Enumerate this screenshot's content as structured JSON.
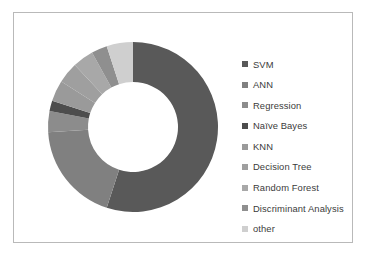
{
  "figure": {
    "background": "#ffffff",
    "frame_color": "#b9b9b9"
  },
  "legend": {
    "position": "right",
    "items": [
      {
        "label": "SVM",
        "color": "#595959",
        "swatch": "square-marker"
      },
      {
        "label": "ANN",
        "color": "#808080",
        "swatch": "square-marker"
      },
      {
        "label": "Regression",
        "color": "#8c8c8c",
        "swatch": "square-marker"
      },
      {
        "label": "Naïve Bayes",
        "color": "#4d4d4d",
        "swatch": "square-marker"
      },
      {
        "label": "KNN",
        "color": "#9a9a9a",
        "swatch": "square-marker"
      },
      {
        "label": "Decision Tree",
        "color": "#9f9f9f",
        "swatch": "square-marker"
      },
      {
        "label": "Random Forest",
        "color": "#a8a8a8",
        "swatch": "square-marker"
      },
      {
        "label": "Discriminant Analysis",
        "color": "#8f8f8f",
        "swatch": "square-marker"
      },
      {
        "label": "other",
        "color": "#cfcfcf",
        "swatch": "square-marker"
      }
    ]
  },
  "chart_data": {
    "type": "pie",
    "variant": "donut",
    "title": "",
    "subtitle": "",
    "xlabel": "",
    "ylabel": "",
    "grid": false,
    "legend_position": "right",
    "start_angle_deg": 0,
    "direction": "clockwise",
    "inner_radius_ratio": 0.53,
    "center": {
      "x": 95,
      "y": 96
    },
    "outer_radius": 85,
    "inner_radius": 45,
    "labels": [
      "SVM",
      "ANN",
      "Regression",
      "Naïve Bayes",
      "KNN",
      "Decision Tree",
      "Random Forest",
      "Discriminant Analysis",
      "other"
    ],
    "values": [
      55,
      19,
      4,
      2,
      4,
      4,
      4,
      3,
      5
    ],
    "colors": [
      "#595959",
      "#808080",
      "#8c8c8c",
      "#4d4d4d",
      "#9a9a9a",
      "#9f9f9f",
      "#a8a8a8",
      "#8f8f8f",
      "#cfcfcf"
    ],
    "angles_deg": [
      198,
      68.4,
      14.4,
      7.2,
      14.4,
      14.4,
      14.4,
      10.8,
      18
    ],
    "units": "percent"
  }
}
